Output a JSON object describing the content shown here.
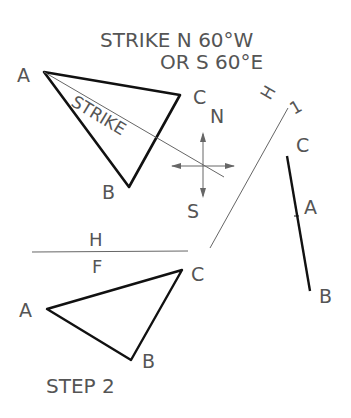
{
  "title": {
    "line1": "STRIKE N 60°W",
    "line2": "OR S 60°E"
  },
  "top_view": {
    "vertex_a": "A",
    "vertex_b": "B",
    "vertex_c": "C",
    "strike_label": "STRIKE"
  },
  "compass": {
    "north": "N",
    "south": "S"
  },
  "fold_line_h1": {
    "label_h": "H",
    "label_1": "1"
  },
  "edge_view": {
    "vertex_c": "C",
    "vertex_a": "A",
    "vertex_b": "B"
  },
  "fold_line_hf": {
    "label_h": "H",
    "label_f": "F"
  },
  "front_view": {
    "vertex_a": "A",
    "vertex_b": "B",
    "vertex_c": "C"
  },
  "step_label": "STEP 2",
  "colors": {
    "ink": "#111111",
    "thin_line": "#666666",
    "label": "#555555"
  }
}
